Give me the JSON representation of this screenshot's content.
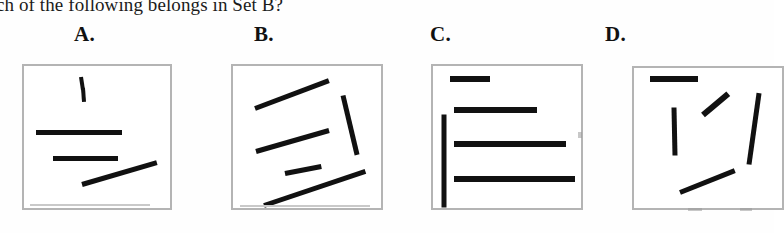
{
  "question": {
    "text": "ch of the following belongs in Set B?"
  },
  "options": [
    {
      "label": "A.",
      "label_x": 74,
      "label_y": 22,
      "box": {
        "x": 22,
        "y": 64,
        "w": 150,
        "h": 146
      },
      "strokes": [
        {
          "name": "short-vertical-line",
          "x1": 57,
          "y1": 11,
          "x2": 59,
          "y2": 24,
          "w": 4
        },
        {
          "name": "short-vertical-line-lower",
          "x1": 59,
          "y1": 22,
          "x2": 60,
          "y2": 36,
          "w": 4
        },
        {
          "name": "long-horizontal-line",
          "x1": 12,
          "y1": 66,
          "x2": 98,
          "y2": 66,
          "w": 5
        },
        {
          "name": "medium-horizontal-line",
          "x1": 29,
          "y1": 92,
          "x2": 94,
          "y2": 92,
          "w": 5
        },
        {
          "name": "rising-diagonal-line",
          "x1": 58,
          "y1": 118,
          "x2": 133,
          "y2": 96,
          "w": 5
        }
      ]
    },
    {
      "label": "B.",
      "label_x": 254,
      "label_y": 22,
      "box": {
        "x": 231,
        "y": 64,
        "w": 152,
        "h": 146
      },
      "strokes": [
        {
          "name": "top-long-diagonal-line",
          "x1": 22,
          "y1": 42,
          "x2": 96,
          "y2": 14,
          "w": 5
        },
        {
          "name": "right-steep-diagonal-line",
          "x1": 110,
          "y1": 29,
          "x2": 124,
          "y2": 88,
          "w": 5
        },
        {
          "name": "middle-diagonal-line",
          "x1": 23,
          "y1": 85,
          "x2": 96,
          "y2": 64,
          "w": 5
        },
        {
          "name": "short-diagonal-line",
          "x1": 52,
          "y1": 107,
          "x2": 88,
          "y2": 100,
          "w": 5
        },
        {
          "name": "bottom-long-diagonal-line",
          "x1": 31,
          "y1": 139,
          "x2": 132,
          "y2": 105,
          "w": 5
        }
      ]
    },
    {
      "label": "C.",
      "label_x": 430,
      "label_y": 22,
      "box": {
        "x": 431,
        "y": 64,
        "w": 152,
        "h": 146
      },
      "strokes": [
        {
          "name": "short-horizontal-line",
          "x1": 17,
          "y1": 13,
          "x2": 57,
          "y2": 13,
          "w": 6
        },
        {
          "name": "medium-horizontal-line",
          "x1": 21,
          "y1": 44,
          "x2": 104,
          "y2": 44,
          "w": 6
        },
        {
          "name": "long-vertical-line",
          "x1": 11,
          "y1": 48,
          "x2": 11,
          "y2": 141,
          "w": 5
        },
        {
          "name": "long-horizontal-line",
          "x1": 21,
          "y1": 78,
          "x2": 133,
          "y2": 78,
          "w": 6
        },
        {
          "name": "longest-horizontal-line",
          "x1": 21,
          "y1": 113,
          "x2": 142,
          "y2": 113,
          "w": 6
        }
      ]
    },
    {
      "label": "D.",
      "label_x": 605,
      "label_y": 22,
      "box": {
        "x": 632,
        "y": 66,
        "w": 152,
        "h": 144
      },
      "strokes": [
        {
          "name": "top-horizontal-line",
          "x1": 16,
          "y1": 11,
          "x2": 64,
          "y2": 11,
          "w": 6
        },
        {
          "name": "vertical-line",
          "x1": 40,
          "y1": 39,
          "x2": 41,
          "y2": 87,
          "w": 5
        },
        {
          "name": "steep-diagonal-line-left",
          "x1": 69,
          "y1": 47,
          "x2": 94,
          "y2": 26,
          "w": 6
        },
        {
          "name": "steep-diagonal-line-right",
          "x1": 115,
          "y1": 96,
          "x2": 125,
          "y2": 25,
          "w": 5
        },
        {
          "name": "bottom-rising-diagonal-line",
          "x1": 46,
          "y1": 124,
          "x2": 101,
          "y2": 102,
          "w": 5
        }
      ]
    }
  ],
  "colors": {
    "ink": "#111111",
    "box_border": "#b4b4b4",
    "page_background": "#fefefe",
    "smudge": "#c9c9c9"
  }
}
